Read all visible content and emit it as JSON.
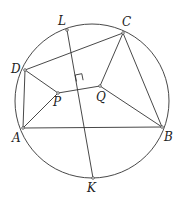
{
  "diagram": {
    "type": "geometry",
    "circle": {
      "cx": 92,
      "cy": 101,
      "r": 77
    },
    "points": {
      "L": {
        "x": 67,
        "y": 30,
        "label": "L",
        "lx": 58,
        "ly": 25
      },
      "C": {
        "x": 123,
        "y": 33,
        "label": "C",
        "lx": 122,
        "ly": 26
      },
      "D": {
        "x": 25,
        "y": 70,
        "label": "D",
        "lx": 11,
        "ly": 73
      },
      "A": {
        "x": 23,
        "y": 128,
        "label": "A",
        "lx": 12,
        "ly": 142
      },
      "B": {
        "x": 162,
        "y": 127,
        "label": "B",
        "lx": 164,
        "ly": 141
      },
      "K": {
        "x": 93,
        "y": 178,
        "label": "K",
        "lx": 87,
        "ly": 192
      },
      "P": {
        "x": 58,
        "y": 93,
        "label": "P",
        "lx": 53,
        "ly": 106
      },
      "Q": {
        "x": 100,
        "y": 86,
        "label": "Q",
        "lx": 96,
        "ly": 101
      }
    },
    "segments": [
      [
        "D",
        "C"
      ],
      [
        "C",
        "B"
      ],
      [
        "A",
        "B"
      ],
      [
        "D",
        "A"
      ],
      [
        "D",
        "P"
      ],
      [
        "A",
        "P"
      ],
      [
        "P",
        "Q"
      ],
      [
        "C",
        "Q"
      ],
      [
        "Q",
        "B"
      ],
      [
        "L",
        "K"
      ]
    ],
    "right_angle": {
      "at": "LK∩PQ"
    },
    "labels": [
      "L",
      "C",
      "D",
      "P",
      "Q",
      "A",
      "B",
      "K"
    ]
  }
}
